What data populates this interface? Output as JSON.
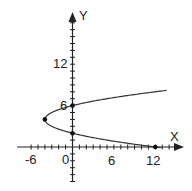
{
  "chart_data": {
    "type": "line",
    "title": "",
    "xlabel": "X",
    "ylabel": "Y",
    "equation": "x = y^2 - 8y + 12",
    "x_ticks_labeled": [
      "-6",
      "0",
      "6",
      "12"
    ],
    "y_ticks_labeled": [
      "6",
      "12"
    ],
    "xlim": [
      -8,
      16
    ],
    "ylim": [
      -5,
      19
    ],
    "grid": false,
    "tick_spacing": 1,
    "series": [
      {
        "name": "parabola",
        "points": [
          {
            "x": 12,
            "y": 0
          },
          {
            "x": 5,
            "y": 1
          },
          {
            "x": 0,
            "y": 2
          },
          {
            "x": -3,
            "y": 3
          },
          {
            "x": -4,
            "y": 4
          },
          {
            "x": -3,
            "y": 5
          },
          {
            "x": 0,
            "y": 6
          },
          {
            "x": 5,
            "y": 7
          },
          {
            "x": 12,
            "y": 8
          },
          {
            "x": 13.8,
            "y": 8.2
          }
        ]
      }
    ],
    "marked_points": [
      {
        "x": -4,
        "y": 4,
        "note": "vertex"
      },
      {
        "x": 0,
        "y": 6
      },
      {
        "x": 0,
        "y": 2
      },
      {
        "x": 12,
        "y": 0
      }
    ]
  },
  "labels": {
    "x_axis": "X",
    "y_axis": "Y",
    "tick_neg6": "-6",
    "tick_0": "0",
    "tick_6x": "6",
    "tick_12x": "12",
    "tick_6y": "6",
    "tick_12y": "12"
  }
}
